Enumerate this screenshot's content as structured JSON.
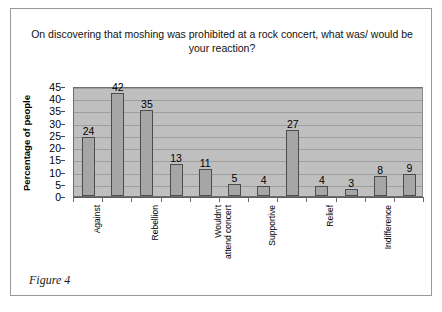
{
  "figure": {
    "caption": "Figure 4"
  },
  "chart_data": {
    "type": "bar",
    "title": "On discovering that moshing was prohibited at a rock concert, what was/ would be your reaction?",
    "title_line1": "On discovering that moshing was prohibited at a rock concert, what was/",
    "title_line2": "would be your reaction?",
    "xlabel": "",
    "ylabel": "Percentage of people",
    "ylim": [
      0,
      45
    ],
    "ytick_step": 5,
    "yticks": [
      45,
      40,
      35,
      30,
      25,
      20,
      15,
      10,
      5,
      0
    ],
    "grid": true,
    "legend": false,
    "bar_color": "#a6a6a6",
    "bar_edge_color": "#4d4d4d",
    "plot_background": "#bfbfbf",
    "categories": [
      "Against",
      "",
      "Rebellion",
      "",
      "Wouldn't attend concert",
      "",
      "Supportive",
      "",
      "Relief",
      "",
      "Indifference",
      ""
    ],
    "visible_xtick_labels": [
      {
        "index": 0,
        "text": "Against",
        "line1": "Against",
        "line2": ""
      },
      {
        "index": 2,
        "text": "Rebellion",
        "line1": "Rebellion",
        "line2": ""
      },
      {
        "index": 4,
        "text": "Wouldn't attend concert",
        "line1": "Wouldn't",
        "line2": "attend concert"
      },
      {
        "index": 6,
        "text": "Supportive",
        "line1": "Supportive",
        "line2": ""
      },
      {
        "index": 8,
        "text": "Relief",
        "line1": "Relief",
        "line2": ""
      },
      {
        "index": 10,
        "text": "Indifference",
        "line1": "Indifference",
        "line2": ""
      }
    ],
    "values": [
      24,
      42,
      35,
      13,
      11,
      5,
      4,
      27,
      4,
      3,
      8,
      9
    ],
    "data_labels": [
      "24",
      "42",
      "35",
      "13",
      "11",
      "5",
      "4",
      "27",
      "4",
      "3",
      "8",
      "9"
    ]
  }
}
